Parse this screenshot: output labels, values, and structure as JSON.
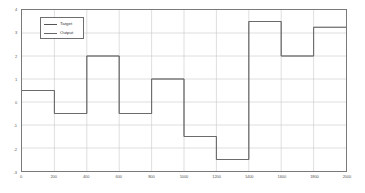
{
  "chart_data": {
    "type": "line",
    "title": "",
    "xlabel": "",
    "ylabel": "",
    "xlim": [
      0,
      2000
    ],
    "ylim": [
      -3,
      4
    ],
    "grid": true,
    "legend_position": "upper-left",
    "xticks": [
      0,
      200,
      400,
      600,
      800,
      1000,
      1200,
      1400,
      1600,
      1800,
      2000
    ],
    "xtick_labels": [
      "0",
      "200",
      "400",
      "600",
      "800",
      "1000",
      "1200",
      "1400",
      "1600",
      "1800",
      "2000"
    ],
    "yticks": [
      -3,
      -2,
      -1,
      0,
      1,
      2,
      3,
      4
    ],
    "ytick_labels": [
      "-3",
      "-2",
      "-1",
      "0",
      "1",
      "2",
      "3",
      "4"
    ],
    "series": [
      {
        "name": "Target",
        "style": "step",
        "color": "#555555",
        "x": [
          0,
          200,
          400,
          600,
          800,
          1000,
          1200,
          1400,
          1600,
          1800,
          2000
        ],
        "values": [
          0.5,
          -0.5,
          2,
          -0.5,
          1,
          -1.5,
          -2.5,
          3.5,
          2,
          3.25,
          3.25
        ]
      },
      {
        "name": "Output",
        "style": "step",
        "color": "#666666",
        "x": [
          0,
          200,
          400,
          600,
          800,
          1000,
          1200,
          1400,
          1600,
          1800,
          2000
        ],
        "values": [
          0.5,
          -0.5,
          2,
          -0.5,
          1,
          -1.5,
          -2.5,
          3.5,
          2,
          3.25,
          3.25
        ]
      }
    ]
  },
  "legend": {
    "items": [
      {
        "label": "Target"
      },
      {
        "label": "Output"
      }
    ]
  },
  "colors": {
    "axis": "#7a7a7a",
    "grid": "#c9c9c9",
    "target": "#555555",
    "output": "#666666",
    "background": "#ffffff"
  }
}
